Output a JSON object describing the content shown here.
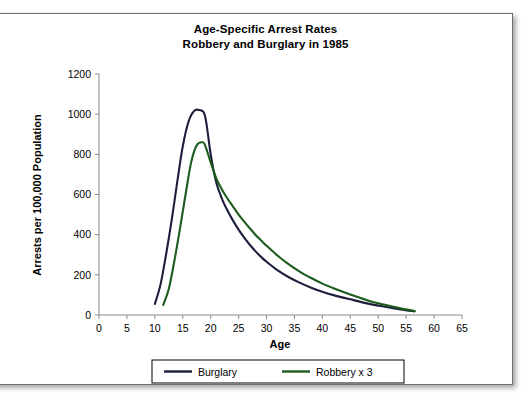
{
  "chart_data": {
    "type": "line",
    "title": "Age-Specific Arrest Rates",
    "subtitle": "Robbery and Burglary in 1985",
    "title_line1": "Age-Specific Arrest Rates",
    "title_line2": "Robbery and Burglary in 1985",
    "xlabel": "Age",
    "ylabel": "Arrests per 100,000 Population",
    "xlim": [
      0,
      65
    ],
    "ylim": [
      0,
      1200
    ],
    "xticks": [
      0,
      5,
      10,
      15,
      20,
      25,
      30,
      35,
      40,
      45,
      50,
      55,
      60,
      65
    ],
    "yticks": [
      0,
      200,
      400,
      600,
      800,
      1000,
      1200
    ],
    "xtick_labels": [
      "0",
      "5",
      "10",
      "15",
      "20",
      "25",
      "30",
      "35",
      "40",
      "45",
      "50",
      "55",
      "60",
      "65"
    ],
    "ytick_labels": [
      "0",
      "200",
      "400",
      "600",
      "800",
      "1000",
      "1200"
    ],
    "grid": false,
    "legend_position": "bottom-center",
    "series": [
      {
        "name": "Burglary",
        "color": "#1b1f3b",
        "x": [
          10,
          11,
          12,
          13,
          14,
          15,
          16,
          17,
          18,
          19,
          20,
          21,
          22,
          23,
          24,
          25,
          26,
          27,
          28,
          29,
          30,
          32,
          34,
          36,
          38,
          40,
          42,
          45,
          48,
          51,
          54,
          56.5
        ],
        "values": [
          55,
          150,
          300,
          470,
          660,
          840,
          960,
          1015,
          1020,
          990,
          800,
          660,
          580,
          520,
          470,
          425,
          385,
          350,
          318,
          290,
          265,
          222,
          188,
          160,
          136,
          116,
          99,
          78,
          58,
          42,
          28,
          18
        ]
      },
      {
        "name": "Robbery x 3",
        "color": "#1d5c1d",
        "x": [
          11.5,
          12.5,
          13.5,
          14.5,
          15.5,
          16.5,
          17.5,
          18.5,
          19,
          20,
          21,
          22,
          23,
          24,
          25,
          26,
          27,
          28,
          29,
          30,
          32,
          34,
          36,
          38,
          40,
          42,
          45,
          48,
          51,
          54,
          56.5
        ],
        "values": [
          50,
          130,
          270,
          430,
          600,
          760,
          845,
          860,
          845,
          760,
          680,
          625,
          580,
          540,
          500,
          465,
          432,
          400,
          372,
          345,
          295,
          252,
          215,
          184,
          156,
          133,
          102,
          74,
          52,
          33,
          20
        ]
      }
    ],
    "legend": [
      {
        "label": "Burglary",
        "color": "#1b1f3b"
      },
      {
        "label": "Robbery x 3",
        "color": "#1d5c1d"
      }
    ]
  }
}
